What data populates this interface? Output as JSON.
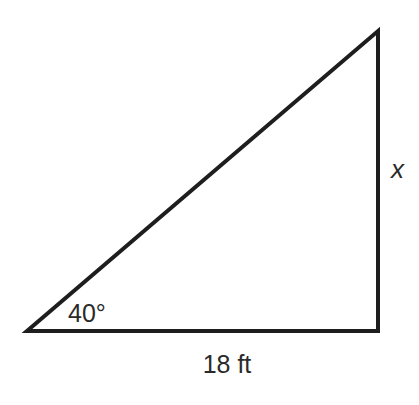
{
  "diagram": {
    "type": "right-triangle",
    "vertices": {
      "bottom_left": [
        27,
        331
      ],
      "right_angle": [
        378,
        331
      ],
      "top": [
        378,
        31
      ]
    },
    "stroke_color": "#1e1e1e",
    "angle_label": "40°",
    "base_label": "18 ft",
    "height_label": "x"
  }
}
